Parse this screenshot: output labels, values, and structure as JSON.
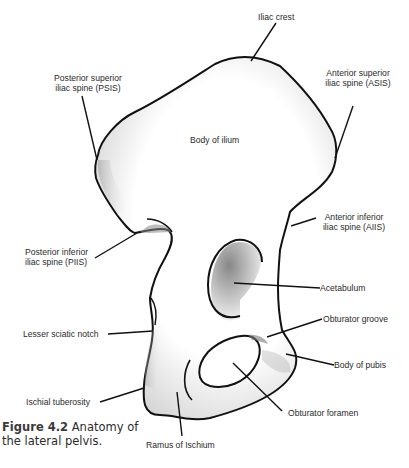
{
  "figure": {
    "number": "Figure 4.2",
    "caption": "Anatomy of the lateral pelvis.",
    "caption_line1": "Anatomy of",
    "caption_line2": "the lateral pelvis."
  },
  "labels": {
    "iliac_crest": "Iliac crest",
    "psis_line1": "Posterior superior",
    "psis_line2": "iliac spine (PSIS)",
    "asis_line1": "Anterior superior",
    "asis_line2": "iliac spine (ASIS)",
    "body_of_ilium": "Body of ilium",
    "piis_line1": "Posterior inferior",
    "piis_line2": "iliac spine (PIIS)",
    "aiis_line1": "Anterior inferior",
    "aiis_line2": "iliac spine (AIIS)",
    "acetabulum": "Acetabulum",
    "lesser_sciatic_notch": "Lesser sciatic notch",
    "obturator_groove": "Obturator groove",
    "body_of_pubis": "Body of pubis",
    "ischial_tuberosity": "Ischial tuberosity",
    "obturator_foramen": "Obturator foramen",
    "ramus_of_ischium": "Ramus of Ischium"
  },
  "colors": {
    "outline": "#111111",
    "fill": "#ffffff",
    "shade": "#8a8a8a",
    "text": "#2a2a2a"
  }
}
